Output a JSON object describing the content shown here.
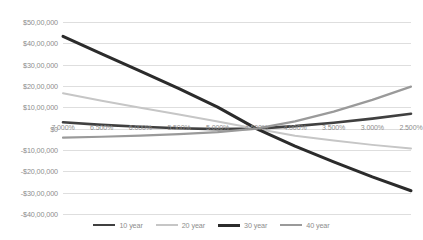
{
  "chart_data": {
    "type": "line",
    "title": "",
    "xlabel": "",
    "ylabel": "",
    "grid": true,
    "legend_position": "bottom",
    "x": [
      "7.000%",
      "6.500%",
      "6.000%",
      "5.500%",
      "5.000%",
      "4.500%",
      "4.000%",
      "3.500%",
      "3.000%",
      "2.500%"
    ],
    "y_ticks": [
      "$50,00,000",
      "$40,00,000",
      "$30,00,000",
      "$20,00,000",
      "$10,00,000",
      "$0",
      "-$10,00,000",
      "-$20,00,000",
      "-$30,00,000",
      "-$40,00,000"
    ],
    "y_tick_values": [
      5000000,
      4000000,
      3000000,
      2000000,
      1000000,
      0,
      -1000000,
      -2000000,
      -3000000,
      -4000000
    ],
    "ylim": [
      -4000000,
      5000000
    ],
    "series": [
      {
        "name": "10 year",
        "color": "#404040",
        "width": 2.6,
        "values": [
          300000,
          180000,
          90000,
          20000,
          -20000,
          0,
          120000,
          280000,
          470000,
          700000
        ]
      },
      {
        "name": "20 year",
        "color": "#c6c6c6",
        "width": 2.0,
        "values": [
          1660000,
          1310000,
          980000,
          660000,
          340000,
          0,
          -330000,
          -560000,
          -760000,
          -930000
        ]
      },
      {
        "name": "30 year",
        "color": "#2b2b2b",
        "width": 3.0,
        "values": [
          4330000,
          3510000,
          2700000,
          1880000,
          1010000,
          0,
          -820000,
          -1560000,
          -2260000,
          -2910000
        ]
      },
      {
        "name": "40 year",
        "color": "#9a9a9a",
        "width": 2.2,
        "values": [
          -420000,
          -380000,
          -330000,
          -260000,
          -160000,
          0,
          340000,
          800000,
          1350000,
          1970000
        ]
      }
    ]
  },
  "legend": {
    "items": [
      {
        "label": "10 year",
        "color": "#404040",
        "width": 2.6
      },
      {
        "label": "20 year",
        "color": "#c6c6c6",
        "width": 2.0
      },
      {
        "label": "30 year",
        "color": "#2b2b2b",
        "width": 3.0
      },
      {
        "label": "40 year",
        "color": "#9a9a9a",
        "width": 2.2
      }
    ]
  },
  "colors": {
    "grid": "#dedede",
    "axis_text": "#8d8d8d",
    "background": "#ffffff"
  }
}
